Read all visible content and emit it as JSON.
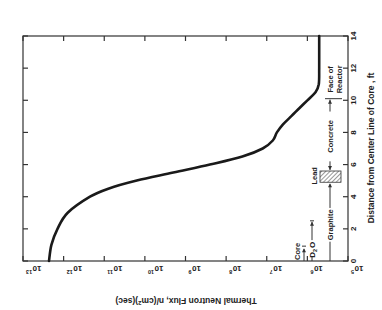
{
  "chart_data": {
    "type": "line",
    "orientation": "rotated-90",
    "title": "",
    "xlabel": "Distance from Center Line of Core , ft",
    "ylabel": "Thermal Neutron Flux, n/(cm²)(sec)",
    "ylabel_parts": {
      "main": "Thermal Neutron Flux, n/(cm",
      "sup": "2",
      "tail": ")(sec)"
    },
    "xlim": [
      0,
      14
    ],
    "ylim_log10": [
      5,
      13
    ],
    "yscale": "log",
    "x_ticks": [
      0,
      2,
      4,
      6,
      8,
      10,
      12,
      14
    ],
    "x_tick_labels": [
      "0",
      "2",
      "4",
      "6",
      "8",
      "10",
      "12",
      "14"
    ],
    "y_ticks_log10": [
      13,
      12,
      11,
      10,
      9,
      8,
      7,
      6,
      5
    ],
    "y_tick_labels": [
      {
        "base": "10",
        "exp": "13"
      },
      {
        "base": "10",
        "exp": "12"
      },
      {
        "base": "10",
        "exp": "11"
      },
      {
        "base": "10",
        "exp": "10"
      },
      {
        "base": "10",
        "exp": "9"
      },
      {
        "base": "10",
        "exp": "8"
      },
      {
        "base": "10",
        "exp": "7"
      },
      {
        "base": "10",
        "exp": "6"
      },
      {
        "base": "10",
        "exp": "5"
      }
    ],
    "grid": false,
    "legend": null,
    "series": [
      {
        "name": "Thermal neutron flux",
        "x": [
          0,
          1,
          2,
          3,
          4,
          4.5,
          5,
          5.5,
          6,
          6.5,
          7,
          7.5,
          8,
          8.5,
          9,
          9.5,
          10,
          10.5,
          11,
          12,
          13,
          14
        ],
        "y_log10": [
          12.36,
          12.3,
          12.15,
          11.9,
          11.35,
          10.9,
          10.2,
          9.3,
          8.4,
          7.6,
          7.1,
          6.85,
          6.75,
          6.6,
          6.4,
          6.2,
          6.0,
          5.8,
          5.72,
          5.71,
          5.71,
          5.71
        ]
      }
    ],
    "annotations": [
      {
        "label": "Core",
        "from": 0,
        "to": 0.8
      },
      {
        "label": "D₂O",
        "label_main": "D",
        "label_sub": "2",
        "label_tail": "O",
        "from": 0,
        "to": 2.5
      },
      {
        "label": "Graphite",
        "from": 0,
        "to": 4.9
      },
      {
        "label": "Lead",
        "from": 4.9,
        "to": 5.6,
        "hatched": true
      },
      {
        "label": "Concrete",
        "from": 5.6,
        "to": 10.1
      },
      {
        "label": "Face of Reactor",
        "line1": "Face of",
        "line2": "Reactor",
        "at": 10.1
      }
    ]
  },
  "colors": {
    "curve": "#1a1a1a",
    "axes": "#333333",
    "text": "#222222",
    "background": "#ffffff"
  }
}
